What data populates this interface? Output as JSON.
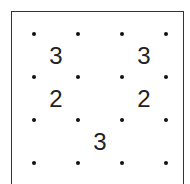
{
  "puzzle": {
    "type": "slitherlink",
    "grid": {
      "rows": 3,
      "cols": 3
    },
    "dots": {
      "cols_x": [
        34,
        78,
        122,
        166
      ],
      "rows_y": [
        34,
        77,
        120,
        163
      ]
    },
    "clues": [
      {
        "row": 0,
        "col": 0,
        "value": "3"
      },
      {
        "row": 0,
        "col": 2,
        "value": "3"
      },
      {
        "row": 1,
        "col": 0,
        "value": "2"
      },
      {
        "row": 1,
        "col": 2,
        "value": "2"
      },
      {
        "row": 2,
        "col": 1,
        "value": "3"
      }
    ]
  }
}
